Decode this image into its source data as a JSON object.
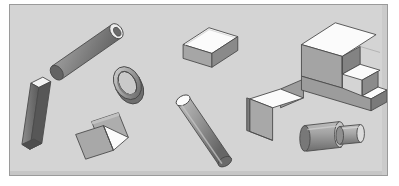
{
  "scene": {
    "title": "3D Shape Arrangement",
    "canvas": {
      "width": 399,
      "height": 186
    },
    "panel": {
      "x": 9,
      "y": 4,
      "width": 379,
      "height": 172
    },
    "background_color": "#ffffff",
    "panel_color": "#d4d4d4",
    "panel_border_color": "#9a9a9a",
    "palette": {
      "outline": "#4a4a4a",
      "face_light": "#ffffff",
      "face_highlight": "#f2f2f2",
      "face_mid": "#b4b4b4",
      "face_dark": "#8e8e8e",
      "face_darker": "#6f6f6f",
      "face_shadow": "#5f5f5f"
    },
    "object_count": 10,
    "objects": [
      {
        "id": "cylinder-tube-upper-left",
        "name": "Hollow cylinder (tube)",
        "type": "cylinder",
        "orientation": "diagonal up-right",
        "position": {
          "x": 57,
          "y": 22
        },
        "size": {
          "length": 62,
          "diameter": 16
        },
        "shading": "dark body, white elliptical open end at upper-right"
      },
      {
        "id": "ring-torus-center-left",
        "name": "Ring (annulus / torus)",
        "type": "ring",
        "orientation": "tilted, facing upper-left",
        "position": {
          "x": 118,
          "y": 66
        },
        "size": {
          "outer_diameter": 25,
          "inner_diameter": 15
        },
        "shading": "light rim with dark inner shadow"
      },
      {
        "id": "prism-long-left",
        "name": "Long slender prism",
        "type": "prism",
        "orientation": "near-vertical, tilted right",
        "position": {
          "x": 20,
          "y": 74
        },
        "size": {
          "length": 76,
          "width": 10
        },
        "shading": "white top face, dark shaft"
      },
      {
        "id": "folded-plates-lower-left",
        "name": "Two overlapping flat plates",
        "type": "plate-pair",
        "orientation": "tilted squares, lower plate in front",
        "position": {
          "x": 74,
          "y": 110
        },
        "size": {
          "plate_edge": 28
        },
        "shading": "mid-gray faces with a white triangular fold"
      },
      {
        "id": "box-top-middle",
        "name": "Rectangular block (brick)",
        "type": "box",
        "orientation": "resting, long axis left-to-right",
        "position": {
          "x": 172,
          "y": 26
        },
        "size": {
          "length": 52,
          "depth": 22,
          "height": 14
        },
        "shading": "white top face, mid-gray front, dark left side"
      },
      {
        "id": "cylinder-diagonal-center",
        "name": "Solid cylinder (rod)",
        "type": "cylinder",
        "orientation": "diagonal down-right",
        "position": {
          "x": 176,
          "y": 99
        },
        "size": {
          "length": 62,
          "diameter": 15
        },
        "shading": "white elliptical top cap, graded dark body"
      },
      {
        "id": "bent-sheet-right",
        "name": "Bent sheet (folded plate)",
        "type": "bent-sheet",
        "orientation": "step fold facing upper-right",
        "position": {
          "x": 249,
          "y": 79
        },
        "size": {
          "width": 42,
          "height": 48
        },
        "shading": "white upper surface, gray walls"
      },
      {
        "id": "staircase-block-top-right",
        "name": "Stepped block (three-step staircase)",
        "type": "staircase",
        "orientation": "steps descending to lower-right",
        "position": {
          "x": 299,
          "y": 18
        },
        "size": {
          "width": 86,
          "height": 58,
          "steps": 3
        },
        "shading": "white step treads, mid-gray front risers, dark left face"
      },
      {
        "id": "stepped-shaft-bottom-right",
        "name": "Stepped shaft (two coaxial cylinders)",
        "type": "cylinder-pair",
        "orientation": "horizontal, small cylinder to the right",
        "position": {
          "x": 296,
          "y": 120
        },
        "size": {
          "large_diameter": 24,
          "small_diameter": 15,
          "length": 56
        },
        "shading": "gray barrels with light end caps"
      },
      {
        "id": "panel-shadow-edge",
        "name": "Panel inner shadow edge",
        "type": "decoration",
        "orientation": "bottom and right inner edge",
        "position": {
          "x": 9,
          "y": 4
        },
        "size": {
          "thickness": 2
        },
        "shading": "subtle darker gray inner border"
      }
    ]
  }
}
